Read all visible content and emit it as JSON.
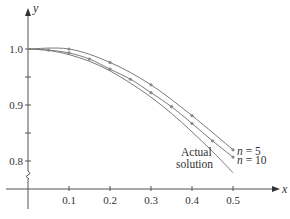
{
  "chart_data": {
    "type": "line",
    "title": "",
    "xlabel": "x",
    "ylabel": "y",
    "xlim": [
      0,
      0.6
    ],
    "ylim": [
      0.8,
      1.02
    ],
    "y_axis_break": true,
    "grid": false,
    "x_ticks": [
      0.1,
      0.2,
      0.3,
      0.4,
      0.5
    ],
    "x_tick_labels": [
      "0.1",
      "0.2",
      "0.3",
      "0.4",
      "0.5"
    ],
    "y_ticks": [
      0.8,
      0.85,
      0.9,
      0.95,
      1.0
    ],
    "y_tick_labels": [
      "0.8",
      "",
      "0.9",
      "",
      "1.0"
    ],
    "series": [
      {
        "name": "n = 5",
        "markers": true,
        "x": [
          0.0,
          0.1,
          0.2,
          0.3,
          0.4,
          0.5
        ],
        "y": [
          1.0,
          1.0,
          0.976,
          0.936,
          0.881,
          0.82
        ]
      },
      {
        "name": "n = 10",
        "markers": true,
        "x": [
          0.0,
          0.05,
          0.1,
          0.15,
          0.2,
          0.25,
          0.3,
          0.35,
          0.4,
          0.45,
          0.5
        ],
        "y": [
          1.0,
          0.998,
          0.993,
          0.982,
          0.964,
          0.946,
          0.922,
          0.897,
          0.867,
          0.836,
          0.807
        ]
      },
      {
        "name": "Actual solution",
        "markers": false,
        "x": [
          0.0,
          0.05,
          0.1,
          0.15,
          0.2,
          0.25,
          0.3,
          0.35,
          0.4,
          0.45,
          0.5
        ],
        "y": [
          1.0,
          0.9975,
          0.99,
          0.978,
          0.961,
          0.939,
          0.914,
          0.885,
          0.852,
          0.817,
          0.779
        ]
      }
    ],
    "annotations": [
      {
        "text": "n = 5",
        "series": "n = 5",
        "position": "right of end"
      },
      {
        "text": "n = 10",
        "series": "n = 10",
        "position": "right of end"
      },
      {
        "text_lines": [
          "Actual",
          "solution"
        ],
        "series": "Actual solution",
        "position": "left of curve end"
      }
    ],
    "legend": "inline annotations"
  },
  "labels": {
    "x_axis": "x",
    "y_axis": "y",
    "n5": "n = 5",
    "n10": "n = 10",
    "actual_line1": "Actual",
    "actual_line2": "solution"
  },
  "colors": {
    "axis": "#555555",
    "curve": "#7a7a7a",
    "marker": "#8a8a8a",
    "text": "#333333"
  }
}
